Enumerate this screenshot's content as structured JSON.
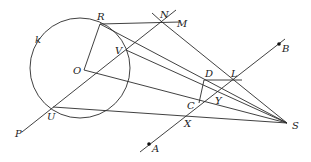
{
  "diagram": {
    "type": "geometry",
    "circle": {
      "label": "k",
      "center": [
        80,
        68
      ],
      "radius": 50
    },
    "points": {
      "R": [
        100,
        24
      ],
      "N": [
        162,
        22
      ],
      "M": [
        172,
        22
      ],
      "O": [
        84,
        70
      ],
      "V": [
        126,
        50
      ],
      "U": [
        53,
        107
      ],
      "P": [
        22,
        132
      ],
      "D": [
        204,
        80
      ],
      "L": [
        233,
        80
      ],
      "C": [
        199,
        103
      ],
      "Y": [
        215,
        92
      ],
      "X": [
        188,
        114
      ],
      "S": [
        287,
        123
      ],
      "A": [
        149,
        144
      ],
      "B": [
        279,
        44
      ]
    },
    "labels": [
      {
        "text": "R",
        "x": 97,
        "y": 20
      },
      {
        "text": "N",
        "x": 160,
        "y": 18
      },
      {
        "text": "M",
        "x": 177,
        "y": 27
      },
      {
        "text": "k",
        "x": 35,
        "y": 43
      },
      {
        "text": "V",
        "x": 115,
        "y": 54
      },
      {
        "text": "O",
        "x": 73,
        "y": 74
      },
      {
        "text": "D",
        "x": 205,
        "y": 77
      },
      {
        "text": "L",
        "x": 231,
        "y": 77
      },
      {
        "text": "B",
        "x": 282,
        "y": 52
      },
      {
        "text": "C",
        "x": 187,
        "y": 109
      },
      {
        "text": "Y",
        "x": 215,
        "y": 104
      },
      {
        "text": "U",
        "x": 47,
        "y": 120
      },
      {
        "text": "X",
        "x": 184,
        "y": 127
      },
      {
        "text": "S",
        "x": 292,
        "y": 129
      },
      {
        "text": "P",
        "x": 15,
        "y": 137
      },
      {
        "text": "A",
        "x": 152,
        "y": 152
      }
    ]
  }
}
